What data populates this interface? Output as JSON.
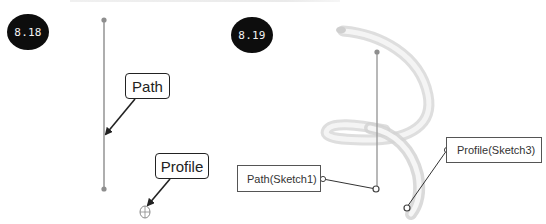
{
  "figures": [
    {
      "id": "fig-8-18",
      "badge": "8.18",
      "callouts": {
        "path": "Path",
        "profile": "Profile"
      }
    },
    {
      "id": "fig-8-19",
      "badge": "8.19",
      "callouts": {
        "path": "Path(Sketch1)",
        "profile": "Profile(Sketch3)"
      }
    }
  ],
  "colors": {
    "badge_bg": "#0d0d0d",
    "line": "#9a9a9a",
    "arrow": "#222222",
    "helix": "#e4e4e4"
  }
}
